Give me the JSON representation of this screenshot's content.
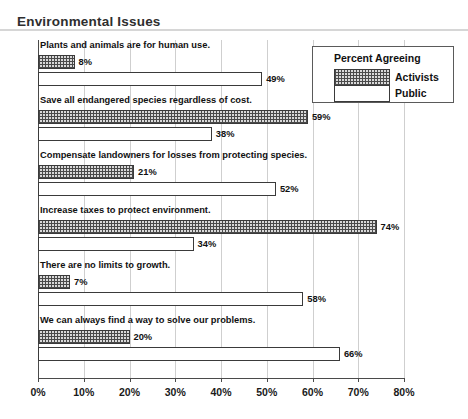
{
  "chart_data": {
    "type": "bar",
    "orientation": "horizontal",
    "title": "Environmental Issues",
    "xlabel": "",
    "ylabel": "",
    "xlim": [
      0,
      80
    ],
    "xtick_labels": [
      "0%",
      "10%",
      "20%",
      "30%",
      "40%",
      "50%",
      "60%",
      "70%",
      "80%"
    ],
    "xticks": [
      0,
      10,
      20,
      30,
      40,
      50,
      60,
      70,
      80
    ],
    "grid": true,
    "grid_axis": "x",
    "legend": {
      "title": "Percent Agreeing",
      "position": "top-right",
      "entries": [
        {
          "name": "Activists",
          "pattern": "crosshatch",
          "fill": "#d9d9d9"
        },
        {
          "name": "Public",
          "pattern": "solid",
          "fill": "#ffffff"
        }
      ]
    },
    "categories": [
      "Plants and animals are for human use.",
      "Save all endangered species regardless of cost.",
      "Compensate landowners for losses from protecting species.",
      "Increase taxes to protect environment.",
      "There are no limits to growth.",
      "We can always find a way to solve our problems."
    ],
    "series": [
      {
        "name": "Activists",
        "values": [
          8,
          59,
          21,
          74,
          7,
          20
        ],
        "value_labels": [
          "8%",
          "59%",
          "21%",
          "74%",
          "7%",
          "20%"
        ]
      },
      {
        "name": "Public",
        "values": [
          49,
          38,
          52,
          34,
          58,
          66
        ],
        "value_labels": [
          "49%",
          "38%",
          "52%",
          "34%",
          "58%",
          "66%"
        ]
      }
    ]
  }
}
